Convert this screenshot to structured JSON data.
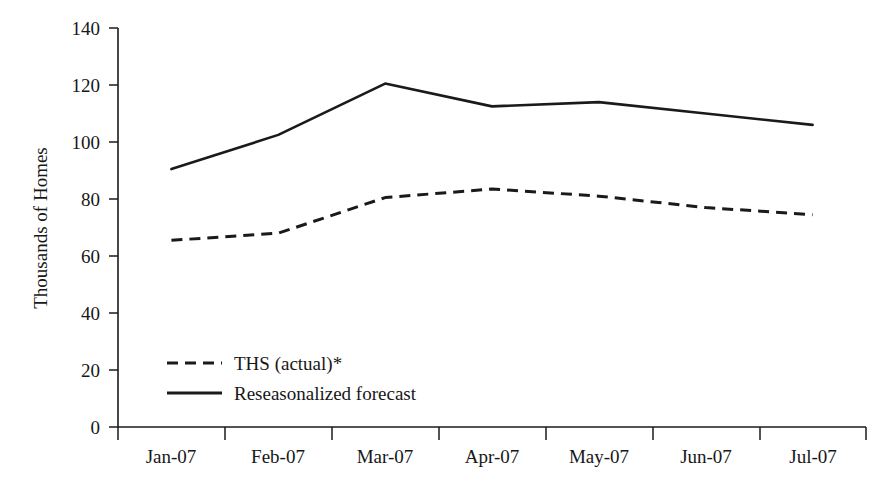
{
  "chart_data": {
    "type": "line",
    "title": "",
    "subtitle": "",
    "xlabel": "",
    "ylabel": "Thousands of Homes",
    "categories": [
      "Jan-07",
      "Feb-07",
      "Mar-07",
      "Apr-07",
      "May-07",
      "Jun-07",
      "Jul-07"
    ],
    "series": [
      {
        "name": "THS (actual)*",
        "style": "dashed",
        "color": "#1a1a1a",
        "values": [
          65.5,
          68,
          80.5,
          83.5,
          81,
          77,
          74.5
        ]
      },
      {
        "name": "Reseasonalized forecast",
        "style": "solid",
        "color": "#1a1a1a",
        "values": [
          90.5,
          102.5,
          120.5,
          112.5,
          114,
          110,
          106
        ]
      }
    ],
    "ylim": [
      0,
      140
    ],
    "ytick_values": [
      0,
      20,
      40,
      60,
      80,
      100,
      120,
      140
    ],
    "ytick_labels": [
      "0",
      "20",
      "40",
      "60",
      "80",
      "100",
      "120",
      "140"
    ],
    "grid": false,
    "legend_position": "inside-lower-left",
    "axis_color": "#1a1a1a"
  },
  "legend": {
    "items": [
      {
        "label": "THS (actual)*",
        "style": "dashed"
      },
      {
        "label": "Reseasonalized forecast",
        "style": "solid"
      }
    ]
  },
  "axes": {
    "y_title": "Thousands of Homes",
    "y_ticks": [
      "140",
      "120",
      "100",
      "80",
      "60",
      "40",
      "20",
      "0"
    ],
    "x_ticks": [
      "Jan-07",
      "Feb-07",
      "Mar-07",
      "Apr-07",
      "May-07",
      "Jun-07",
      "Jul-07"
    ]
  }
}
